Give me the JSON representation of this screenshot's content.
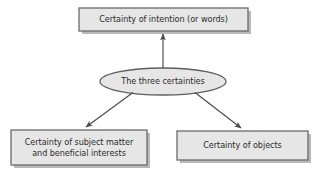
{
  "diagram": {
    "title": "The three certainties",
    "type": "hub-and-spoke",
    "colors": {
      "node_fill": "#e6e6e6",
      "node_border": "#6b6b6b",
      "node_shadow": "#b8b8b8",
      "arrow": "#4a4a4a",
      "text": "#2b2b2b",
      "background": "#ffffff"
    },
    "centre": {
      "id": "three-certainties",
      "shape": "ellipse",
      "label": "The three certainties"
    },
    "nodes": [
      {
        "id": "certainty-of-intention",
        "shape": "rectangle",
        "position": "top",
        "label": "Certainty of intention (or words)"
      },
      {
        "id": "certainty-of-subject-matter",
        "shape": "rectangle",
        "position": "bottom-left",
        "label": "Certainty of subject matter\nand beneficial interests"
      },
      {
        "id": "certainty-of-objects",
        "shape": "rectangle",
        "position": "bottom-right",
        "label": "Certainty of objects"
      }
    ],
    "edges": [
      {
        "id": "edge-to-intention",
        "from": "three-certainties",
        "to": "certainty-of-intention",
        "direction": "up",
        "arrowhead": "end"
      },
      {
        "id": "edge-to-subject-matter",
        "from": "three-certainties",
        "to": "certainty-of-subject-matter",
        "direction": "down-left",
        "arrowhead": "end"
      },
      {
        "id": "edge-to-objects",
        "from": "three-certainties",
        "to": "certainty-of-objects",
        "direction": "down-right",
        "arrowhead": "end"
      }
    ]
  }
}
